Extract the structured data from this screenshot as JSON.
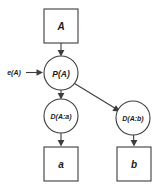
{
  "diagram": {
    "background_color": "#ffffff",
    "stroke_color": "#3d3d3d",
    "text_color": "#1a1a1a",
    "nodes": [
      {
        "id": "A",
        "label": "A",
        "shape": "box",
        "cx": 61,
        "cy": 26,
        "w": 34,
        "h": 34
      },
      {
        "id": "PA",
        "label": "P(A)",
        "shape": "circle",
        "cx": 61,
        "cy": 73,
        "r": 17
      },
      {
        "id": "DAa",
        "label": "D(A:a)",
        "shape": "circle",
        "cx": 61,
        "cy": 116,
        "r": 17
      },
      {
        "id": "DAb",
        "label": "D(A:b)",
        "shape": "circle",
        "cx": 133,
        "cy": 118,
        "r": 17
      },
      {
        "id": "a",
        "label": "a",
        "shape": "box",
        "cx": 61,
        "cy": 164,
        "w": 34,
        "h": 34
      },
      {
        "id": "b",
        "label": "b",
        "shape": "box",
        "cx": 134,
        "cy": 164,
        "w": 34,
        "h": 34
      }
    ],
    "edges": [
      {
        "id": "e-A-PA",
        "from": "A",
        "to": "PA",
        "arrow": true
      },
      {
        "id": "e-PA-DAa",
        "from": "PA",
        "to": "DAa",
        "arrow": true
      },
      {
        "id": "e-PA-DAb",
        "from": "PA",
        "to": "DAb",
        "arrow": true
      },
      {
        "id": "e-DAa-a",
        "from": "DAa",
        "to": "a",
        "arrow": true
      },
      {
        "id": "e-DAb-b",
        "from": "DAb",
        "to": "b",
        "arrow": true
      },
      {
        "id": "e-eA-PA",
        "from": "eA",
        "to": "PA",
        "arrow": true,
        "label": "e(A)"
      }
    ],
    "edge_labels": {
      "input_excitation": "e(A)"
    }
  }
}
